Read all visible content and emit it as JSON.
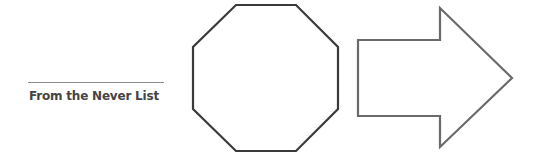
{
  "caption": {
    "text": "From the Never List"
  },
  "shapes": {
    "octagon": {
      "label": "octagon",
      "stroke": "#3a3a3a"
    },
    "arrow": {
      "label": "right-arrow",
      "stroke": "#6a6a6a"
    }
  }
}
